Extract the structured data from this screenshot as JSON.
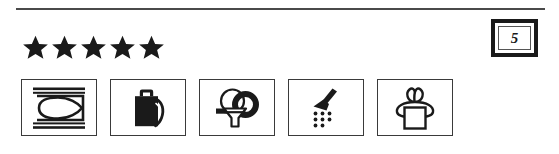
{
  "page": {
    "background_color": "#ffffff",
    "ink_color": "#1a1a1a",
    "divider_color": "#4a4a4a"
  },
  "divider": {
    "name": "horizontal-rule"
  },
  "rating": {
    "stars_shown": 5,
    "stars_total": 5,
    "star_glyph": "★",
    "star_color": "#1a1a1a",
    "aria_label": "5 out of 5 stars"
  },
  "rating_badge": {
    "value": "5",
    "border_color": "#1a1a1a",
    "inner_border_color": "#555555"
  },
  "symbols": [
    {
      "id": "iron",
      "icon": "iron-icon",
      "label": "Iron",
      "filled": false
    },
    {
      "id": "bottle",
      "icon": "bottle-icon",
      "label": "Bottle",
      "filled": true
    },
    {
      "id": "funnel-coil",
      "icon": "funnel-coil-icon",
      "label": "Funnel with coil",
      "filled": false
    },
    {
      "id": "shower-spray",
      "icon": "shower-spray-icon",
      "label": "Shower spray",
      "filled": true
    },
    {
      "id": "gift-bow",
      "icon": "gift-bow-icon",
      "label": "Gift with bow",
      "filled": false
    }
  ]
}
